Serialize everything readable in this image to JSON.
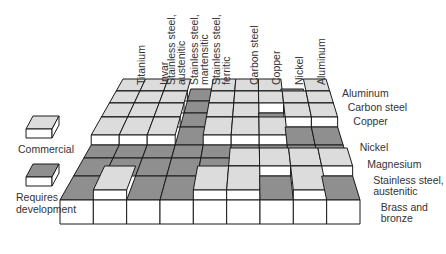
{
  "diagram": {
    "columns": [
      {
        "label": "Titanium"
      },
      {
        "label": "Invar"
      },
      {
        "label": "Stainless steel,\naustenitic"
      },
      {
        "label": "Stainless steel,\nmartensitic"
      },
      {
        "label": "Stainless steel,\nferritic"
      },
      {
        "label": "Carbon steel"
      },
      {
        "label": "Copper"
      },
      {
        "label": "Nickel"
      },
      {
        "label": "Aluminum"
      }
    ],
    "rows": [
      {
        "label": "Aluminum",
        "cells": [
          "C",
          "C",
          "C",
          "D",
          "C",
          "C",
          "C",
          "D",
          "C"
        ]
      },
      {
        "label": "Carbon steel",
        "cells": [
          "C",
          "C",
          "C",
          "D",
          "C",
          "C",
          "C",
          "C",
          "C"
        ]
      },
      {
        "label": "Copper",
        "cells": [
          "C",
          "C",
          "C",
          "D",
          "C",
          "C",
          "D",
          "C",
          "C"
        ]
      },
      {
        "label": "Nickel",
        "cells": [
          "C",
          "C",
          "C",
          "D",
          "C",
          "C",
          "C",
          "D",
          "D"
        ]
      },
      {
        "label": "Magnesium",
        "cells": [
          "D",
          "D",
          "D",
          "D",
          "D",
          "D",
          "D",
          "D",
          "D"
        ]
      },
      {
        "label": "Stainless steel,\naustenitic",
        "cells": [
          "D",
          "D",
          "D",
          "D",
          "D",
          "C",
          "C",
          "C",
          "C"
        ]
      },
      {
        "label": "Brass and\nbronze",
        "cells": [
          "D",
          "C",
          "D",
          "D",
          "C",
          "C",
          "D",
          "C",
          "D"
        ]
      }
    ],
    "legend": [
      {
        "key": "C",
        "label": "Commercial"
      },
      {
        "key": "D",
        "label": "Requires\ndevelopment"
      }
    ],
    "colors": {
      "commercial_top": "#dcdcdc",
      "development_top": "#8f8f8f",
      "side_face": "#ffffff",
      "outline": "#1a1a1a"
    }
  }
}
